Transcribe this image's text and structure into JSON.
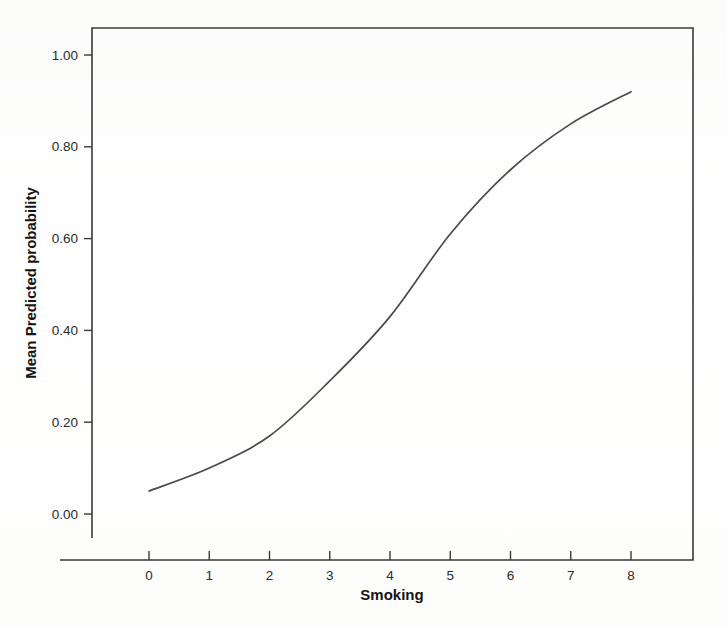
{
  "figure": {
    "background_color": "#fdfdfd",
    "line_color": "#4a4a4a",
    "axis_color": "#3a3a3a",
    "text_color": "#2b2b2b"
  },
  "chart_data": {
    "type": "line",
    "title": "",
    "xlabel": "Smoking",
    "ylabel": "Mean Predicted probability",
    "x": [
      0,
      1,
      2,
      3,
      4,
      5,
      6,
      7,
      8
    ],
    "values": [
      0.05,
      0.1,
      0.17,
      0.29,
      0.43,
      0.61,
      0.75,
      0.85,
      0.92
    ],
    "series": [
      {
        "name": "Mean Predicted probability",
        "values": [
          0.05,
          0.1,
          0.17,
          0.29,
          0.43,
          0.61,
          0.75,
          0.85,
          0.92
        ]
      }
    ],
    "xlim": [
      -0.9,
      9.1
    ],
    "ylim": [
      -0.12,
      1.12
    ],
    "x_ticks": [
      0,
      1,
      2,
      3,
      4,
      5,
      6,
      7,
      8
    ],
    "x_tick_labels": [
      "0",
      "1",
      "2",
      "3",
      "4",
      "5",
      "6",
      "7",
      "8"
    ],
    "y_ticks": [
      0.0,
      0.2,
      0.4,
      0.6,
      0.8,
      1.0
    ],
    "y_tick_labels": [
      "0.00",
      "0.20",
      "0.40",
      "0.60",
      "0.80",
      "1.00"
    ],
    "grid": false,
    "legend": false,
    "legend_position": "none"
  }
}
